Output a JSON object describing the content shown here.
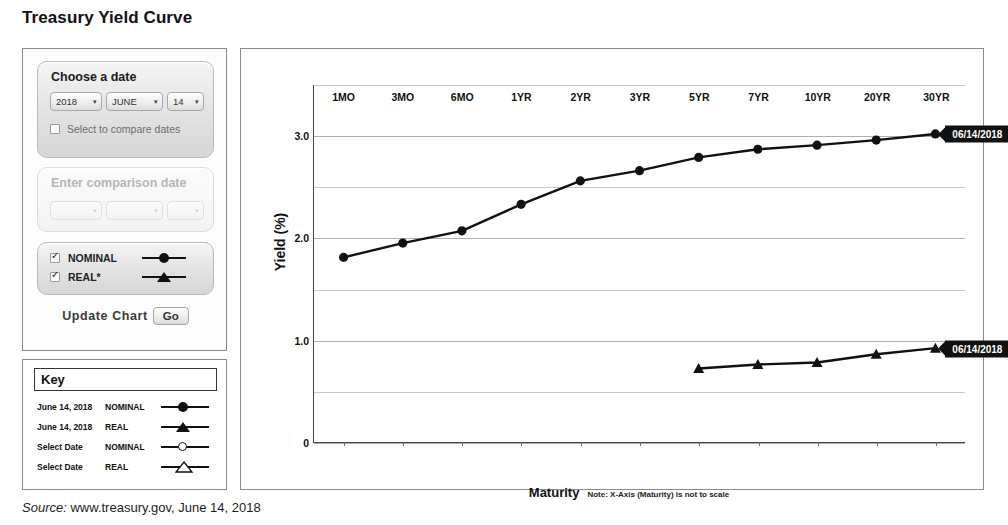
{
  "page_title": "Treasury Yield Curve",
  "source": {
    "label": "Source:",
    "text": "www.treasury.gov, June 14, 2018"
  },
  "controls": {
    "choose_date": {
      "title": "Choose a date",
      "year": "2018",
      "month": "JUNE",
      "day": "14",
      "arrow": "▾",
      "compare_checkbox_label": "Select to compare dates",
      "compare_checked": false
    },
    "comparison": {
      "title": "Enter comparison date",
      "year": "",
      "month": "",
      "day": "",
      "arrow": "▾",
      "disabled": true
    },
    "series_toggles": [
      {
        "label": "NOMINAL",
        "checked": true,
        "symbol": "filled-circle"
      },
      {
        "label": "REAL*",
        "checked": true,
        "symbol": "filled-triangle"
      }
    ],
    "update": {
      "label": "Update Chart",
      "button": "Go"
    }
  },
  "key": {
    "title": "Key",
    "rows": [
      {
        "date": "June 14, 2018",
        "type": "NOMINAL",
        "symbol": "filled-circle"
      },
      {
        "date": "June 14, 2018",
        "type": "REAL",
        "symbol": "filled-triangle"
      },
      {
        "date": "Select Date",
        "type": "NOMINAL",
        "symbol": "open-circle"
      },
      {
        "date": "Select Date",
        "type": "REAL",
        "symbol": "open-triangle"
      }
    ]
  },
  "chart_data": {
    "type": "line",
    "title": "Treasury Yield Curve",
    "xlabel": "Maturity",
    "ylabel": "Yield (%)",
    "note": "Note: X-Axis (Maturity) is not to scale",
    "categories": [
      "1MO",
      "3MO",
      "6MO",
      "1YR",
      "2YR",
      "3YR",
      "5YR",
      "7YR",
      "10YR",
      "20YR",
      "30YR"
    ],
    "ylim": [
      0,
      3.5
    ],
    "yticks": [
      0,
      0.5,
      1.0,
      1.5,
      2.0,
      2.5,
      3.0,
      3.5
    ],
    "ytick_labels": [
      "0",
      "",
      "1.0",
      "",
      "2.0",
      "",
      "3.0",
      ""
    ],
    "grid": true,
    "legend": "callout-labels",
    "series": [
      {
        "name": "NOMINAL",
        "label": "06/14/2018",
        "marker": "filled-circle",
        "values": [
          1.81,
          1.95,
          2.07,
          2.33,
          2.56,
          2.66,
          2.79,
          2.87,
          2.91,
          2.96,
          3.02
        ]
      },
      {
        "name": "REAL",
        "label": "06/14/2018",
        "marker": "filled-triangle",
        "values": [
          null,
          null,
          null,
          null,
          null,
          null,
          0.72,
          0.76,
          0.78,
          0.86,
          0.92
        ]
      }
    ]
  }
}
